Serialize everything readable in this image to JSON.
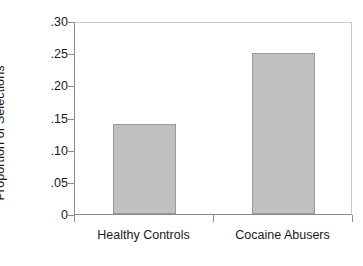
{
  "chart_data": {
    "type": "bar",
    "title": "",
    "xlabel": "",
    "ylabel": "Proportion of Selections",
    "categories": [
      "Healthy Controls",
      "Cocaine Abusers"
    ],
    "values": [
      0.14,
      0.25
    ],
    "value_labels": [
      ".14",
      ".25"
    ],
    "ylim": [
      0,
      0.3
    ],
    "yticks": [
      0,
      0.05,
      0.1,
      0.15,
      0.2,
      0.25,
      0.3
    ],
    "ytick_labels": [
      "0",
      ".05",
      ".10",
      ".15",
      ".20",
      ".25",
      ".30"
    ],
    "grid": false,
    "legend": null,
    "bar_color": "#c0c0c0",
    "bar_edge_color": "#9a9a9a",
    "axis_color": "#8a8a8a",
    "background": "#ffffff"
  }
}
